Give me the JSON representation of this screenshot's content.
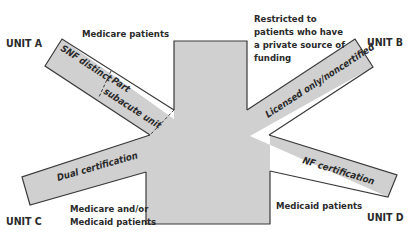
{
  "diagram": {
    "type": "facility-certification-diagram",
    "colors": {
      "fill": "#d0d0d0",
      "stroke": "#3a3a3a",
      "text": "#2a2a2a",
      "background": "#ffffff"
    },
    "units": {
      "a": {
        "label": "UNIT A",
        "arm_label_1": "SNF distinct",
        "arm_label_2a": "Part",
        "arm_label_2b": "subacute unit",
        "caption": "Medicare patients"
      },
      "b": {
        "label": "UNIT B",
        "arm_label": "Licensed only/noncertified",
        "caption_lines": [
          "Restricted to",
          "patients who have",
          "a private source of",
          "funding"
        ]
      },
      "c": {
        "label": "UNIT C",
        "arm_label": "Dual certification",
        "caption_lines": [
          "Medicare and/or",
          "Medicaid patients"
        ]
      },
      "d": {
        "label": "UNIT D",
        "arm_label": "NF certification",
        "caption": "Medicaid patients"
      }
    }
  }
}
